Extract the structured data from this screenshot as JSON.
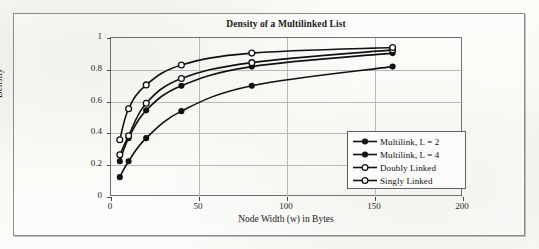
{
  "chart_data": {
    "type": "line",
    "title": "Density of a Multilinked List",
    "xlabel": "Node Width (w) in Bytes",
    "ylabel": "Density",
    "xlim": [
      0,
      200
    ],
    "ylim": [
      0,
      1
    ],
    "xticks": [
      "0",
      "50",
      "100",
      "150",
      "200"
    ],
    "xtick_values": [
      0,
      50,
      100,
      150,
      200
    ],
    "yticks": [
      "0",
      "0.2",
      "0.4",
      "0.6",
      "0.8",
      "1"
    ],
    "ytick_values": [
      0,
      0.2,
      0.4,
      0.6,
      0.8,
      1
    ],
    "grid": true,
    "legend_position": "lower right (inside plot)",
    "x": [
      5,
      10,
      20,
      40,
      80,
      160
    ],
    "series": [
      {
        "name": "Multilink, L = 2",
        "marker": "filled-circle",
        "color": "#111111",
        "values": [
          0.225,
          0.37,
          0.545,
          0.7,
          0.82,
          0.905
        ]
      },
      {
        "name": "Multilink, L = 4",
        "marker": "filled-circle",
        "color": "#111111",
        "values": [
          0.125,
          0.225,
          0.37,
          0.54,
          0.7,
          0.82
        ]
      },
      {
        "name": "Doubly Linked",
        "marker": "open-circle",
        "color": "#111111",
        "values": [
          0.265,
          0.385,
          0.59,
          0.745,
          0.845,
          0.925
        ]
      },
      {
        "name": "Singly Linked",
        "marker": "open-circle",
        "color": "#111111",
        "values": [
          0.36,
          0.555,
          0.705,
          0.83,
          0.905,
          0.94
        ]
      }
    ]
  }
}
